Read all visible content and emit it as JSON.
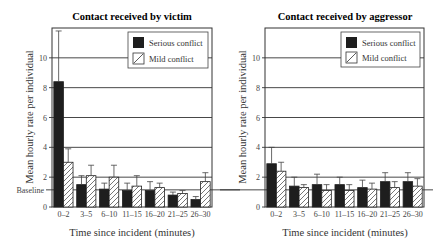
{
  "chart_data": [
    {
      "type": "bar",
      "title": "Contact received by victim",
      "xlabel": "Time since incident (minutes)",
      "ylabel": "Mean hourly rate per individual",
      "ylim": [
        0,
        12
      ],
      "yticks": [
        0,
        2,
        4,
        6,
        8,
        10
      ],
      "grid": "horizontal",
      "legend_position": "top-right",
      "categories": [
        "0–2",
        "3–5",
        "6–10",
        "11–15",
        "16–20",
        "21–25",
        "26–30"
      ],
      "series": [
        {
          "name": "Serious conflict",
          "style": "solid",
          "values": [
            8.4,
            1.5,
            1.2,
            1.1,
            1.1,
            0.8,
            0.5
          ],
          "error_upper": [
            11.8,
            2.1,
            1.6,
            1.6,
            1.7,
            1.0,
            0.7
          ]
        },
        {
          "name": "Mild conflict",
          "style": "hatched",
          "values": [
            3.0,
            2.1,
            2.0,
            1.4,
            1.3,
            0.9,
            1.7
          ],
          "error_upper": [
            3.9,
            2.8,
            2.8,
            2.1,
            1.6,
            1.1,
            2.3
          ]
        }
      ],
      "baseline": {
        "label": "Baseline",
        "value": 1.15
      }
    },
    {
      "type": "bar",
      "title": "Contact received by aggressor",
      "xlabel": "Time since incident (minutes)",
      "ylabel": "Mean hourly rate per individual",
      "ylim": [
        0,
        12
      ],
      "yticks": [
        0,
        2,
        4,
        6,
        8,
        10
      ],
      "grid": "horizontal",
      "legend_position": "top-right",
      "categories": [
        "0–2",
        "3–5",
        "6–10",
        "11–15",
        "16–20",
        "21–25",
        "26–30"
      ],
      "series": [
        {
          "name": "Serious conflict",
          "style": "solid",
          "values": [
            2.9,
            1.4,
            1.5,
            1.5,
            1.3,
            1.7,
            1.7
          ],
          "error_upper": [
            4.0,
            2.0,
            2.2,
            2.0,
            1.8,
            2.3,
            2.3
          ]
        },
        {
          "name": "Mild conflict",
          "style": "hatched",
          "values": [
            2.4,
            1.3,
            1.1,
            1.1,
            1.2,
            1.3,
            1.4
          ],
          "error_upper": [
            3.0,
            1.5,
            1.5,
            1.5,
            1.6,
            1.7,
            1.9
          ]
        }
      ],
      "baseline": {
        "label": "Baseline",
        "value": 1.15
      }
    }
  ],
  "colors": {
    "serious": "#1e1e1e",
    "mild_fill": "#ffffff",
    "axis": "#333333"
  }
}
